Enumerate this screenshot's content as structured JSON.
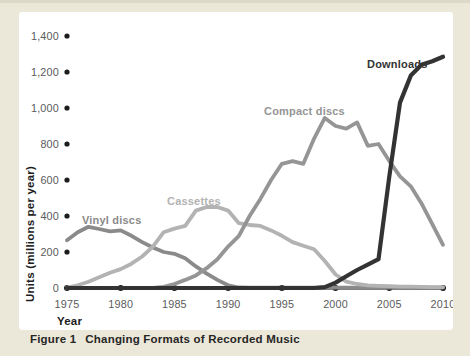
{
  "figure": {
    "caption_label": "Figure 1",
    "caption_title": "Changing Formats of Recorded Music"
  },
  "chart_data": {
    "type": "line",
    "title": "Changing Formats of Recorded Music",
    "xlabel": "Year",
    "ylabel": "Units (millions per year)",
    "x_range": [
      1975,
      2010
    ],
    "y_range": [
      0,
      1400
    ],
    "grid": false,
    "legend": "inline-labels-near-lines",
    "axis_color": "#4a4a4a",
    "tick_dot_color": "#1c1c1c",
    "tick_label_color": "#5a5a5a",
    "x_ticks": [
      "1975",
      "1980",
      "1985",
      "1990",
      "1995",
      "2000",
      "2005",
      "2010"
    ],
    "y_ticks": [
      {
        "value": 0,
        "label": "0"
      },
      {
        "value": 200,
        "label": "200"
      },
      {
        "value": 400,
        "label": "400"
      },
      {
        "value": 600,
        "label": "600"
      },
      {
        "value": 800,
        "label": "800"
      },
      {
        "value": 1000,
        "label": "1,000"
      },
      {
        "value": 1200,
        "label": "1,200"
      },
      {
        "value": 1400,
        "label": "1,400"
      }
    ],
    "years": [
      1975,
      1976,
      1977,
      1978,
      1979,
      1980,
      1981,
      1982,
      1983,
      1984,
      1985,
      1986,
      1987,
      1988,
      1989,
      1990,
      1991,
      1992,
      1993,
      1994,
      1995,
      1996,
      1997,
      1998,
      1999,
      2000,
      2001,
      2002,
      2003,
      2004,
      2005,
      2006,
      2007,
      2008,
      2009,
      2010
    ],
    "series": [
      {
        "name": "Vinyl discs",
        "color": "#8a8a8a",
        "values": [
          265,
          310,
          340,
          328,
          315,
          320,
          290,
          255,
          225,
          200,
          190,
          165,
          120,
          80,
          45,
          15,
          3,
          2,
          2,
          2,
          2,
          2,
          2,
          2,
          2,
          2,
          2,
          2,
          2,
          2,
          2,
          2,
          2,
          2,
          2,
          2
        ]
      },
      {
        "name": "Cassettes",
        "color": "#b3b3b3",
        "values": [
          3,
          15,
          35,
          60,
          85,
          105,
          135,
          175,
          230,
          310,
          330,
          345,
          430,
          450,
          450,
          430,
          360,
          350,
          345,
          320,
          290,
          255,
          235,
          215,
          150,
          75,
          35,
          22,
          15,
          12,
          10,
          8,
          7,
          6,
          5,
          5
        ]
      },
      {
        "name": "Compact discs",
        "color": "#959595",
        "values": [
          0,
          0,
          0,
          0,
          0,
          0,
          0,
          0,
          0,
          6,
          22,
          45,
          70,
          110,
          160,
          230,
          290,
          400,
          495,
          600,
          690,
          705,
          690,
          830,
          945,
          900,
          885,
          920,
          790,
          800,
          705,
          620,
          565,
          470,
          355,
          240
        ]
      },
      {
        "name": "Downloads",
        "color": "#333333",
        "values": [
          0,
          0,
          0,
          0,
          0,
          0,
          0,
          0,
          0,
          0,
          0,
          0,
          0,
          0,
          0,
          0,
          0,
          0,
          0,
          0,
          0,
          0,
          0,
          0,
          5,
          30,
          65,
          100,
          130,
          160,
          620,
          1030,
          1180,
          1240,
          1260,
          1285
        ]
      }
    ]
  }
}
